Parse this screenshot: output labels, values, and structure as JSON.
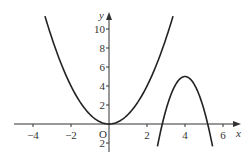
{
  "chart_data": {
    "type": "line",
    "title": "",
    "xlabel": "x",
    "ylabel": "y",
    "origin_label": "O",
    "xlim": [
      -5.2,
      6.9
    ],
    "ylim": [
      -3,
      11.8
    ],
    "grid": false,
    "x_ticks": [
      -4,
      -2,
      2,
      4,
      6
    ],
    "x_tick_labels": [
      "−4",
      "−2",
      "2",
      "4",
      "6"
    ],
    "y_ticks": [
      -2,
      2,
      4,
      6,
      8,
      10
    ],
    "y_tick_labels": [
      "2",
      "2",
      "4",
      "6",
      "8",
      "10"
    ],
    "series": [
      {
        "name": "parabola",
        "formula": "y = x^2",
        "x_range": [
          -3.37,
          3.37
        ],
        "points": [
          [
            -3.37,
            11.36
          ],
          [
            -3,
            9
          ],
          [
            -2,
            4
          ],
          [
            -1,
            1
          ],
          [
            0,
            0
          ],
          [
            1,
            1
          ],
          [
            2,
            4
          ],
          [
            3,
            9
          ],
          [
            3.37,
            11.36
          ]
        ]
      },
      {
        "name": "inverted-parabola",
        "formula": "y = 5 - 3.5(x-4)^2",
        "x_range": [
          2.55,
          5.45
        ],
        "vertex": [
          4,
          5
        ],
        "points": [
          [
            2.55,
            -2.36
          ],
          [
            2.8,
            -0.04
          ],
          [
            3,
            1.5
          ],
          [
            3.5,
            4.13
          ],
          [
            4,
            5
          ],
          [
            4.5,
            4.13
          ],
          [
            5,
            1.5
          ],
          [
            5.2,
            -0.04
          ],
          [
            5.45,
            -2.36
          ]
        ]
      }
    ],
    "colors": {
      "curve": "#222222",
      "axis": "#333333",
      "text": "#333333"
    }
  }
}
